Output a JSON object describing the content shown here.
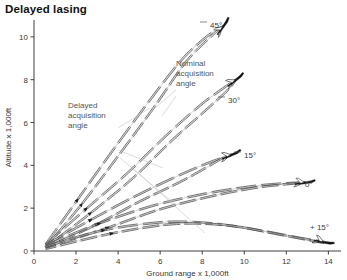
{
  "title": "Delayed lasing",
  "chart_data": {
    "type": "line",
    "title": "Delayed lasing",
    "xlabel": "Ground range x 1,000ft",
    "ylabel": "Altitude x 1,000ft",
    "xlim": [
      0,
      14.6
    ],
    "ylim": [
      0,
      10.6
    ],
    "xticks": [
      "0",
      "2",
      "4",
      "6",
      "8",
      "10",
      "12",
      "14"
    ],
    "xtick_values": [
      0,
      2,
      4,
      6,
      8,
      10,
      12,
      14
    ],
    "yticks": [
      "0",
      "2",
      "4",
      "6",
      "8",
      "10"
    ],
    "ytick_values": [
      0,
      2,
      4,
      6,
      8,
      10
    ],
    "grid": false,
    "legend": "none",
    "annotations": [
      {
        "text": "Delayed acquisition angle",
        "lines": [
          "Delayed",
          "acquisition",
          "angle"
        ]
      },
      {
        "text": "Nominal acquisition angle",
        "lines": [
          "Nominal",
          "acquisition",
          "angle"
        ]
      }
    ],
    "series": [
      {
        "name": "45 deg nominal",
        "label": "45°",
        "kind": "nominal",
        "x": [
          0.55,
          2.0,
          3.6,
          5.4,
          7.0,
          8.2,
          9.0
        ],
        "y": [
          0.3,
          2.3,
          4.5,
          6.9,
          8.9,
          10.0,
          10.5
        ]
      },
      {
        "name": "45 deg delayed",
        "label": "45°",
        "kind": "delayed",
        "x": [
          0.55,
          2.2,
          3.9,
          5.7,
          7.2,
          8.4,
          9.0
        ],
        "y": [
          0.18,
          2.1,
          4.3,
          6.7,
          8.8,
          10.0,
          10.5
        ]
      },
      {
        "name": "30 deg nominal",
        "label": "30°",
        "kind": "nominal",
        "x": [
          0.55,
          2.4,
          4.4,
          6.3,
          7.9,
          9.0,
          9.6
        ],
        "y": [
          0.3,
          1.9,
          3.6,
          5.4,
          6.8,
          7.6,
          8.0
        ]
      },
      {
        "name": "30 deg delayed",
        "label": "30°",
        "kind": "delayed",
        "x": [
          0.55,
          2.6,
          4.7,
          6.6,
          8.2,
          9.2,
          9.6
        ],
        "y": [
          0.18,
          1.7,
          3.4,
          5.2,
          6.6,
          7.5,
          8.0
        ]
      },
      {
        "name": "15 deg nominal",
        "label": "15°",
        "kind": "nominal",
        "x": [
          0.55,
          2.6,
          4.7,
          6.6,
          8.0,
          8.8,
          9.4
        ],
        "y": [
          0.28,
          1.4,
          2.5,
          3.4,
          4.0,
          4.3,
          4.5
        ]
      },
      {
        "name": "15 deg delayed",
        "label": "15°",
        "kind": "delayed",
        "x": [
          0.55,
          2.9,
          5.0,
          6.9,
          8.2,
          8.9,
          9.4
        ],
        "y": [
          0.16,
          1.2,
          2.3,
          3.2,
          3.9,
          4.3,
          4.5
        ]
      },
      {
        "name": "0 deg nominal",
        "label": "0°",
        "kind": "nominal",
        "x": [
          0.55,
          3.0,
          5.6,
          8.0,
          10.2,
          11.8,
          12.9
        ],
        "y": [
          0.25,
          1.25,
          2.1,
          2.65,
          3.0,
          3.15,
          3.2
        ]
      },
      {
        "name": "0 deg delayed",
        "label": "0°",
        "kind": "delayed",
        "x": [
          0.55,
          3.4,
          6.0,
          8.4,
          10.5,
          12.0,
          12.9
        ],
        "y": [
          0.14,
          1.05,
          1.95,
          2.55,
          2.95,
          3.12,
          3.2
        ]
      },
      {
        "name": "+15 deg nominal",
        "label": "+ 15°",
        "kind": "nominal",
        "x": [
          0.55,
          3.2,
          5.8,
          7.6,
          9.4,
          11.2,
          12.6,
          13.8
        ],
        "y": [
          0.2,
          0.95,
          1.32,
          1.35,
          1.18,
          0.88,
          0.62,
          0.42
        ]
      },
      {
        "name": "+15 deg delayed",
        "label": "+ 15°",
        "kind": "delayed",
        "x": [
          0.55,
          3.6,
          6.2,
          8.0,
          9.8,
          11.4,
          12.8,
          13.8
        ],
        "y": [
          0.1,
          0.8,
          1.22,
          1.28,
          1.12,
          0.82,
          0.56,
          0.38
        ]
      }
    ],
    "endpoint_markers": [
      {
        "label": "45°",
        "x": 9.0,
        "y": 10.5,
        "rotation": -48
      },
      {
        "label": "30°",
        "x": 9.6,
        "y": 8.0,
        "rotation": -32
      },
      {
        "label": "15°",
        "x": 9.4,
        "y": 4.5,
        "rotation": -17
      },
      {
        "label": "0°",
        "x": 12.9,
        "y": 3.2,
        "rotation": -2
      },
      {
        "label": "+ 15°",
        "x": 13.8,
        "y": 0.42,
        "rotation": 16
      }
    ]
  }
}
